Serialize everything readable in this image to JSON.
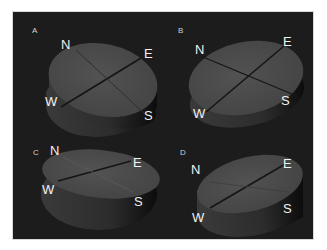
{
  "figure": {
    "background": "#1c1c1c",
    "disc_top_color": "#4a4a4a",
    "disc_side_color": "#2a2a2a",
    "axis_line_color": "#111111",
    "panels": [
      {
        "label": "A",
        "north": "N",
        "east": "E",
        "south": "S",
        "west": "W"
      },
      {
        "label": "B",
        "north": "N",
        "east": "E",
        "south": "S",
        "west": "W"
      },
      {
        "label": "C",
        "north": "N",
        "east": "E",
        "south": "S",
        "west": "W"
      },
      {
        "label": "D",
        "north": "N",
        "east": "E",
        "south": "S",
        "west": "W"
      }
    ]
  }
}
